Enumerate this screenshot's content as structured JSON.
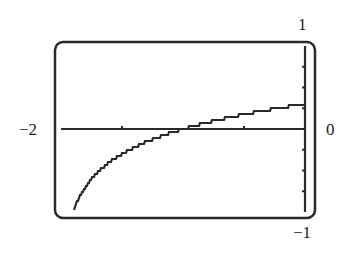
{
  "chart_data": {
    "type": "line",
    "title": "",
    "xlabel": "",
    "ylabel": "",
    "xlim": [
      -2,
      0
    ],
    "ylim": [
      -1,
      1
    ],
    "x_tick_labels": {
      "min": "−2",
      "max": "0"
    },
    "y_tick_labels": {
      "max": "1",
      "min": "−1"
    },
    "x_ticks": [
      -1.5,
      -1,
      -0.5
    ],
    "y_ticks": [
      -0.75,
      -0.5,
      -0.25,
      0.25,
      0.5,
      0.75
    ],
    "grid": false,
    "legend": null,
    "style": "graphing-calculator screen, pixelated stair-step curve, rounded frame",
    "series": [
      {
        "name": "y = log10(x + 2)",
        "x": [
          -1.9,
          -1.8,
          -1.7,
          -1.6,
          -1.5,
          -1.4,
          -1.3,
          -1.2,
          -1.1,
          -1.0,
          -0.9,
          -0.8,
          -0.7,
          -0.6,
          -0.5,
          -0.4,
          -0.3,
          -0.2,
          -0.1,
          0.0
        ],
        "y": [
          -1.0,
          -0.7,
          -0.52,
          -0.4,
          -0.3,
          -0.22,
          -0.15,
          -0.1,
          -0.05,
          0.0,
          0.04,
          0.08,
          0.11,
          0.15,
          0.18,
          0.2,
          0.23,
          0.26,
          0.28,
          0.3
        ]
      }
    ]
  },
  "labels": {
    "x_min": "−2",
    "x_max": "0",
    "y_max": "1",
    "y_min": "−1"
  },
  "colors": {
    "frame": "#2a2a2a",
    "curve": "#2a2a2a",
    "axis": "#2a2a2a",
    "background": "#ffffff"
  }
}
